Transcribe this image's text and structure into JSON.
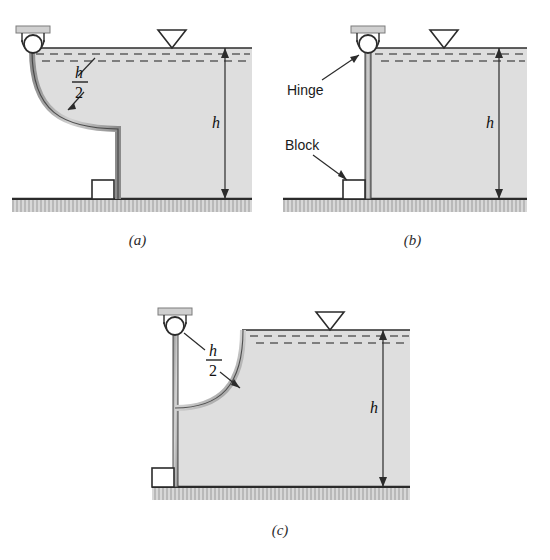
{
  "figure": {
    "colors": {
      "water_fill": "#dcdcdc",
      "water_dash": "#4d4d4d",
      "gate": "#b3b3b3",
      "outline": "#2b2b2b",
      "ground": "#c9c9c9",
      "background": "#ffffff"
    }
  },
  "panels": [
    {
      "id": "a",
      "caption": "(a)",
      "gate_type": "curved-concave-left",
      "labels": {
        "depth": "h",
        "half_depth_numerator": "h",
        "half_depth_denominator": "2"
      },
      "components": [
        "hinge",
        "hinge-bracket",
        "curved-gate",
        "block",
        "water",
        "ground",
        "water-surface-symbol",
        "depth-dimension"
      ]
    },
    {
      "id": "b",
      "caption": "(b)",
      "gate_type": "straight-vertical",
      "labels": {
        "depth": "h",
        "hinge": "Hinge",
        "block": "Block"
      },
      "components": [
        "hinge",
        "hinge-bracket",
        "straight-gate",
        "block",
        "water",
        "ground",
        "water-surface-symbol",
        "depth-dimension"
      ]
    },
    {
      "id": "c",
      "caption": "(c)",
      "gate_type": "curved-concave-up",
      "labels": {
        "depth": "h",
        "half_depth_numerator": "h",
        "half_depth_denominator": "2"
      },
      "components": [
        "hinge",
        "hinge-bracket",
        "rod",
        "curved-gate",
        "block",
        "water",
        "ground",
        "water-surface-symbol",
        "depth-dimension"
      ]
    }
  ]
}
